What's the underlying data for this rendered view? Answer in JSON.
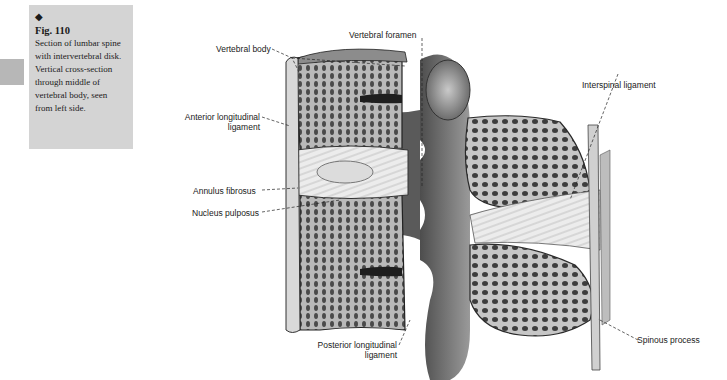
{
  "caption": {
    "marker": "◆",
    "figure_number": "Fig. 110",
    "lines": [
      "Section of lumbar spine",
      "with intervertebral disk.",
      "Vertical cross-section",
      "through middle of",
      "vertebral body, seen",
      "from left side."
    ]
  },
  "labels": {
    "vertebral_body": "Vertebral body",
    "vertebral_foramen": "Vertebral foramen",
    "interspinal_ligament": "Interspinal ligament",
    "anterior_longitudinal_line1": "Anterior longitudinal",
    "anterior_longitudinal_line2": "ligament",
    "annulus_fibrosus": "Annulus fibrosus",
    "nucleus_pulposus": "Nucleus pulposus",
    "posterior_longitudinal_line1": "Posterior longitudinal",
    "posterior_longitudinal_line2": "ligament",
    "spinous_process": "Spinous process"
  },
  "colors": {
    "caption_bg": "#d4d4d4",
    "side_tab": "#b7b7b7",
    "bone_dark": "#3a3a3a",
    "bone_mid": "#8a8a8a",
    "disk_light": "#e6e6e6"
  }
}
